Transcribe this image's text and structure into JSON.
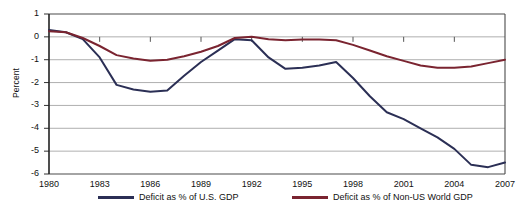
{
  "chart_data": {
    "type": "line",
    "title": "",
    "xlabel": "",
    "ylabel": "Percent",
    "xlim": [
      1980,
      2007
    ],
    "ylim": [
      -6,
      1
    ],
    "grid": true,
    "legend_position": "bottom",
    "x_ticks": [
      "1980",
      "1983",
      "1986",
      "1989",
      "1992",
      "1995",
      "1998",
      "2001",
      "2004",
      "2007"
    ],
    "y_ticks": [
      "1",
      "0",
      "-1",
      "-2",
      "-3",
      "-4",
      "-5",
      "-6"
    ],
    "x": [
      1980,
      1981,
      1982,
      1983,
      1984,
      1985,
      1986,
      1987,
      1988,
      1989,
      1990,
      1991,
      1992,
      1993,
      1994,
      1995,
      1996,
      1997,
      1998,
      1999,
      2000,
      2001,
      2002,
      2003,
      2004,
      2005,
      2006,
      2007
    ],
    "series": [
      {
        "name": "Deficit as % of U.S. GDP",
        "color": "#2b2f55",
        "values": [
          0.3,
          0.2,
          -0.1,
          -0.9,
          -2.1,
          -2.3,
          -2.4,
          -2.35,
          -1.7,
          -1.1,
          -0.6,
          -0.1,
          -0.15,
          -0.9,
          -1.4,
          -1.35,
          -1.25,
          -1.1,
          -1.8,
          -2.6,
          -3.3,
          -3.6,
          -4.0,
          -4.4,
          -4.9,
          -5.6,
          -5.7,
          -5.5
        ]
      },
      {
        "name": "Deficit as % of Non-US World GDP",
        "color": "#7a2430",
        "values": [
          0.25,
          0.2,
          -0.05,
          -0.4,
          -0.8,
          -0.95,
          -1.05,
          -1.0,
          -0.85,
          -0.65,
          -0.4,
          -0.05,
          0.0,
          -0.1,
          -0.15,
          -0.12,
          -0.12,
          -0.15,
          -0.35,
          -0.6,
          -0.85,
          -1.05,
          -1.25,
          -1.35,
          -1.35,
          -1.3,
          -1.15,
          -1.0
        ]
      }
    ]
  },
  "axes": {
    "plot_left_px": 49,
    "plot_right_px": 505,
    "plot_top_px": 14,
    "plot_bottom_px": 174
  }
}
